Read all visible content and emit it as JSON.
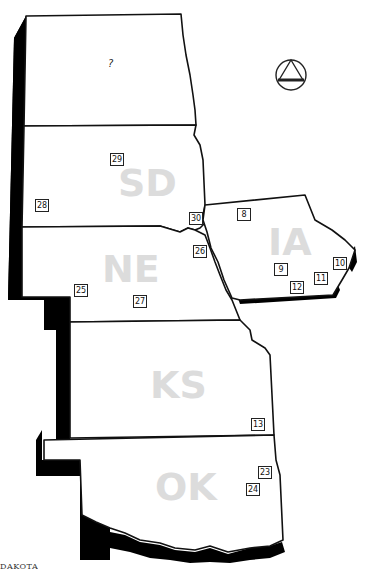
{
  "map": {
    "states": [
      {
        "id": "north-dakota",
        "label": "?"
      },
      {
        "id": "south-dakota",
        "label": "SD"
      },
      {
        "id": "nebraska",
        "label": "NE"
      },
      {
        "id": "iowa",
        "label": "IA"
      },
      {
        "id": "kansas",
        "label": "KS"
      },
      {
        "id": "oklahoma",
        "label": "OK"
      }
    ],
    "markers": [
      {
        "id": "8",
        "state": "IA"
      },
      {
        "id": "9",
        "state": "IA"
      },
      {
        "id": "10",
        "state": "IA"
      },
      {
        "id": "11",
        "state": "IA"
      },
      {
        "id": "12",
        "state": "IA"
      },
      {
        "id": "13",
        "state": "KS"
      },
      {
        "id": "23",
        "state": "OK"
      },
      {
        "id": "24",
        "state": "OK"
      },
      {
        "id": "25",
        "state": "NE"
      },
      {
        "id": "26",
        "state": "NE"
      },
      {
        "id": "27",
        "state": "NE"
      },
      {
        "id": "28",
        "state": "SD"
      },
      {
        "id": "29",
        "state": "SD"
      },
      {
        "id": "30",
        "state": "SD"
      }
    ],
    "symbol": "triangle-in-circle",
    "caption": "DAKOTA",
    "colors": {
      "outline": "#111111",
      "shadow": "#000000",
      "label": "#dcdcdc",
      "background": "#ffffff"
    }
  }
}
